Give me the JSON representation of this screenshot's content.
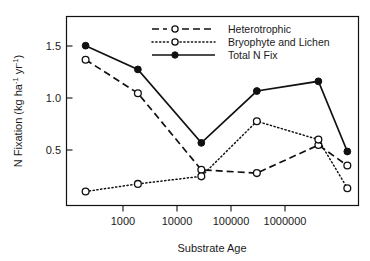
{
  "chart_data": {
    "type": "line",
    "title": "",
    "xlabel": "Substrate Age",
    "ylabel": "N Fixation (kg ha-1 yr-1)",
    "ylabel_parts": {
      "prefix": "N Fixation (kg ha",
      "sup1": "-1",
      "mid": " yr",
      "sup2": "-1",
      "suffix": ")"
    },
    "x_scale": "log",
    "x": [
      300,
      2000,
      20000,
      150000,
      1400000,
      4000000
    ],
    "xlim": [
      150,
      6000000
    ],
    "ylim": [
      0.0,
      1.75
    ],
    "x_ticks": [
      1000,
      10000,
      100000,
      1000000
    ],
    "x_tick_labels": [
      "1000",
      "10000",
      "100000",
      "1000000"
    ],
    "y_ticks": [
      0.5,
      1.0,
      1.5
    ],
    "y_tick_labels": [
      "0.5",
      "1.0",
      "1.5"
    ],
    "grid": false,
    "legend_position": "top-center",
    "series": [
      {
        "name": "Heterotrophic",
        "values": [
          1.35,
          1.04,
          0.33,
          0.3,
          0.56,
          0.37
        ],
        "line_style": "dashed",
        "marker": "open-circle",
        "color": "#111111"
      },
      {
        "name": "Bryophyte and Lichen",
        "values": [
          0.13,
          0.2,
          0.27,
          0.78,
          0.61,
          0.16
        ],
        "line_style": "dotted",
        "marker": "open-circle",
        "color": "#111111"
      },
      {
        "name": "Total N Fix",
        "values": [
          1.48,
          1.26,
          0.58,
          1.06,
          1.15,
          0.5
        ],
        "line_style": "solid",
        "marker": "filled-circle",
        "color": "#111111"
      }
    ]
  }
}
